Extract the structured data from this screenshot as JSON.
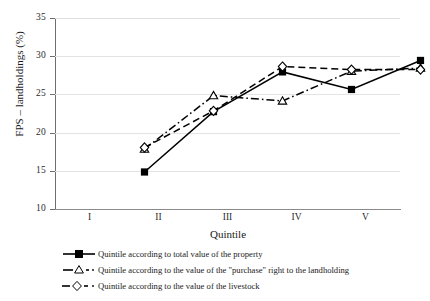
{
  "chart_data": {
    "type": "line",
    "title": "",
    "subtitle": "",
    "xlabel": "Quintile",
    "ylabel": "FPS – landholdings (%)",
    "categories": [
      "I",
      "II",
      "III",
      "IV",
      "V"
    ],
    "ylim": [
      10,
      35
    ],
    "yticks": [
      10,
      15,
      20,
      25,
      30,
      35
    ],
    "ytick_labels": [
      "10",
      "15",
      "20",
      "25",
      "30",
      "35"
    ],
    "grid": true,
    "legend_position": "below",
    "series": [
      {
        "name": "Quintile according to total value of the property",
        "marker": "filled-square",
        "line_style": "solid",
        "color": "#000000",
        "values": [
          17.2,
          25.1,
          30.3,
          28.0,
          31.8
        ]
      },
      {
        "name": "Quintile according to the value of the \"purchase\" right to the landholding",
        "marker": "open-triangle",
        "line_style": "dash-dot",
        "color": "#000000",
        "values": [
          20.2,
          27.2,
          26.5,
          30.4,
          30.8
        ]
      },
      {
        "name": "Quintile according to the value of the livestock",
        "marker": "open-diamond",
        "line_style": "dashed",
        "color": "#000000",
        "values": [
          20.4,
          25.2,
          31.0,
          30.6,
          30.6
        ]
      }
    ]
  }
}
